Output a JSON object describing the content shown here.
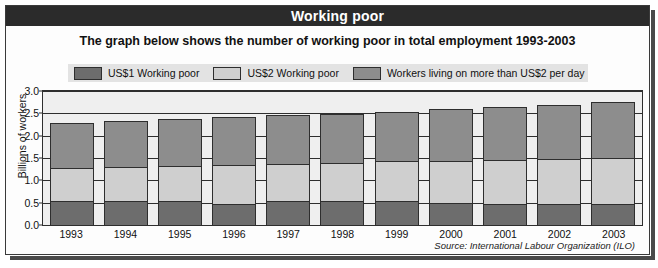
{
  "title": "Working poor",
  "subtitle": "The graph below shows the number of working poor in total employment 1993-2003",
  "source": "Source: International Labour Organization (ILO)",
  "legend": {
    "items": [
      {
        "label": "US$1 Working poor",
        "color": "#6d6d6d"
      },
      {
        "label": "US$2 Working poor",
        "color": "#cfcfcf"
      },
      {
        "label": "Workers living on more than US$2 per day",
        "color": "#8d8d8d"
      }
    ]
  },
  "colors": {
    "title_bar": "#2b2b2b",
    "plot_background": "#efefef",
    "frame_border": "#3a3a3a",
    "legend_background": "#e3e3e3",
    "us1": "#6d6d6d",
    "us2": "#cfcfcf",
    "above_us2": "#8d8d8d"
  },
  "chart_data": {
    "type": "bar",
    "title": "Working poor",
    "subtitle": "The graph below shows the number of working poor in total employment 1993-2003",
    "xlabel": "",
    "ylabel": "Billions of workers",
    "ylim": [
      0.0,
      3.0
    ],
    "yticks": [
      "0.0",
      "0.5",
      "1.0",
      "1.5",
      "2.0",
      "2.5",
      "3.0"
    ],
    "grid": true,
    "stacked": true,
    "legend_position": "top",
    "categories": [
      "1993",
      "1994",
      "1995",
      "1996",
      "1997",
      "1998",
      "1999",
      "2000",
      "2001",
      "2002",
      "2003"
    ],
    "series": [
      {
        "name": "US$1 Working poor",
        "color": "#6d6d6d",
        "values": [
          0.55,
          0.55,
          0.57,
          0.5,
          0.55,
          0.55,
          0.55,
          0.52,
          0.5,
          0.5,
          0.5
        ]
      },
      {
        "name": "US$2 Working poor",
        "color": "#cfcfcf",
        "values": [
          0.78,
          0.8,
          0.8,
          0.88,
          0.85,
          0.88,
          0.92,
          0.95,
          1.0,
          1.02,
          1.05
        ]
      },
      {
        "name": "Workers living on more than US$2 per day",
        "color": "#8d8d8d",
        "values": [
          1.02,
          1.05,
          1.07,
          1.1,
          1.12,
          1.12,
          1.13,
          1.2,
          1.21,
          1.24,
          1.27
        ]
      }
    ],
    "totals": [
      2.35,
      2.4,
      2.44,
      2.48,
      2.52,
      2.55,
      2.6,
      2.67,
      2.71,
      2.76,
      2.82
    ]
  }
}
